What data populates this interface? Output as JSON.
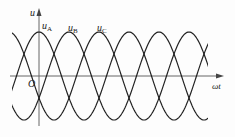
{
  "diagram": {
    "type": "three-phase sinusoidal voltage waveform",
    "axes": {
      "y_label": "u",
      "x_label": "ωt",
      "origin_label": "O"
    },
    "curves": [
      {
        "name": "uA",
        "label_main": "u",
        "label_sub": "A",
        "phase_deg": 0
      },
      {
        "name": "uB",
        "label_main": "u",
        "label_sub": "B",
        "phase_deg": -120
      },
      {
        "name": "uC",
        "label_main": "u",
        "label_sub": "C",
        "phase_deg": 120
      }
    ],
    "colors": {
      "line": "#222222",
      "axis": "#555555",
      "background": "#fdfdfd"
    }
  }
}
